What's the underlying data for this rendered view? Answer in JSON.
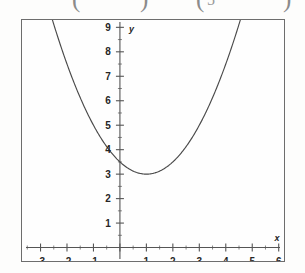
{
  "top_fragments": {
    "note": "cropped bottoms of a math expression above the figure",
    "items": [
      {
        "text": "(",
        "x": 72,
        "type": "paren-open"
      },
      {
        "text": ")",
        "x": 140,
        "type": "paren-close"
      },
      {
        "text": "(",
        "x": 196,
        "type": "paren-open"
      },
      {
        "text": "5",
        "x": 207,
        "type": "digit"
      },
      {
        "text": ")",
        "x": 283,
        "type": "paren-close"
      }
    ]
  },
  "chart_data": {
    "type": "line",
    "title": "",
    "subtitle": "",
    "xlabel": "x",
    "ylabel": "y",
    "xlim": [
      -3.7,
      6.2
    ],
    "ylim": [
      -0.55,
      9.3
    ],
    "grid": false,
    "legend": null,
    "axes": {
      "x_axis_at_y": 0,
      "y_axis_at_x": 0,
      "x_tick_labels": [
        "-3",
        "-2",
        "-1",
        "1",
        "2",
        "3",
        "4",
        "5",
        "6"
      ],
      "x_tick_values": [
        -3,
        -2,
        -1,
        1,
        2,
        3,
        4,
        5,
        6
      ],
      "x_major_ticks": [
        -3,
        -2,
        -1,
        0,
        1,
        2,
        3,
        4,
        5,
        6
      ],
      "x_minor_ticks": [
        -3.5,
        -2.5,
        -1.5,
        -0.5,
        0.5,
        1.5,
        2.5,
        3.5,
        4.5,
        5.5
      ],
      "y_tick_labels": [
        "1",
        "2",
        "3",
        "4",
        "5",
        "6",
        "7",
        "8",
        "9"
      ],
      "y_tick_values": [
        1,
        2,
        3,
        4,
        5,
        6,
        7,
        8,
        9
      ],
      "y_major_ticks": [
        1,
        2,
        3,
        4,
        5,
        6,
        7,
        8,
        9
      ],
      "y_minor_ticks": [
        0.5,
        1.5,
        2.5,
        3.5,
        4.5,
        5.5,
        6.5,
        7.5,
        8.5
      ]
    },
    "series": [
      {
        "name": "parabola",
        "kind": "parabola",
        "equation": "y = 0.5(x - 1)^2 + 3",
        "vertex": [
          1,
          3
        ],
        "leading_coefficient": 0.5,
        "y_intercept": 3.5,
        "color": "#4a4a4a",
        "x": [
          -2.5,
          -2.25,
          -2,
          -1.75,
          -1.5,
          -1.25,
          -1,
          -0.75,
          -0.5,
          -0.25,
          0,
          0.25,
          0.5,
          0.75,
          1,
          1.25,
          1.5,
          1.75,
          2,
          2.25,
          2.5,
          2.75,
          3,
          3.25,
          3.5,
          3.75,
          4,
          4.25,
          4.5
        ],
        "y": [
          9.13,
          8.28,
          7.5,
          6.78,
          6.13,
          5.53,
          5.0,
          4.53,
          4.13,
          3.78,
          3.5,
          3.28,
          3.13,
          3.03,
          3.0,
          3.03,
          3.13,
          3.28,
          3.5,
          3.78,
          4.13,
          4.53,
          5.0,
          5.53,
          6.13,
          6.78,
          7.5,
          8.28,
          9.13
        ]
      }
    ]
  }
}
